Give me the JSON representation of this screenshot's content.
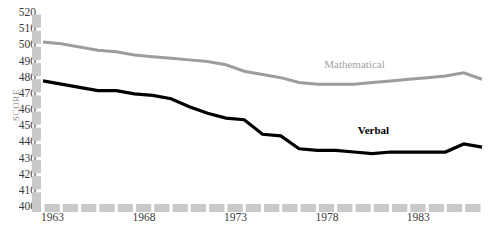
{
  "chart_data": {
    "type": "line",
    "title": "",
    "subtitle": "",
    "xlabel": "",
    "ylabel": "SCORE",
    "ylim": [
      400,
      520
    ],
    "xlim": [
      1963,
      1987
    ],
    "grid": false,
    "legend_position": "inline-right",
    "y_ticks": [
      520,
      510,
      500,
      490,
      480,
      470,
      460,
      450,
      440,
      430,
      420,
      410,
      400
    ],
    "x_ticks": [
      1963,
      1968,
      1973,
      1978,
      1983
    ],
    "x_tick_labels": [
      "1963",
      "1968",
      "1973",
      "1978",
      "1983"
    ],
    "x": [
      1963,
      1964,
      1965,
      1966,
      1967,
      1968,
      1969,
      1970,
      1971,
      1972,
      1973,
      1974,
      1975,
      1976,
      1977,
      1978,
      1979,
      1980,
      1981,
      1982,
      1983,
      1984,
      1985,
      1986,
      1987
    ],
    "series": [
      {
        "name": "Mathematical",
        "color": "#9d9d9d",
        "label_x": 1981.0,
        "label_y": 488,
        "values": [
          502,
          501,
          499,
          497,
          496,
          494,
          493,
          492,
          491,
          490,
          488,
          484,
          482,
          480,
          477,
          476,
          476,
          476,
          477,
          478,
          479,
          480,
          481,
          483,
          479
        ]
      },
      {
        "name": "Verbal",
        "color": "#000000",
        "label_x": 1981.3,
        "label_y": 447,
        "values": [
          478,
          476,
          474,
          472,
          472,
          470,
          469,
          467,
          462,
          458,
          455,
          454,
          445,
          444,
          436,
          435,
          435,
          434,
          433,
          434,
          434,
          434,
          434,
          439,
          437
        ]
      }
    ],
    "annotations": []
  },
  "axis": {
    "y_axis_style": "segmented-gray-bar",
    "x_axis_style": "segmented-gray-bar",
    "axis_color": "#c9c9c9"
  }
}
